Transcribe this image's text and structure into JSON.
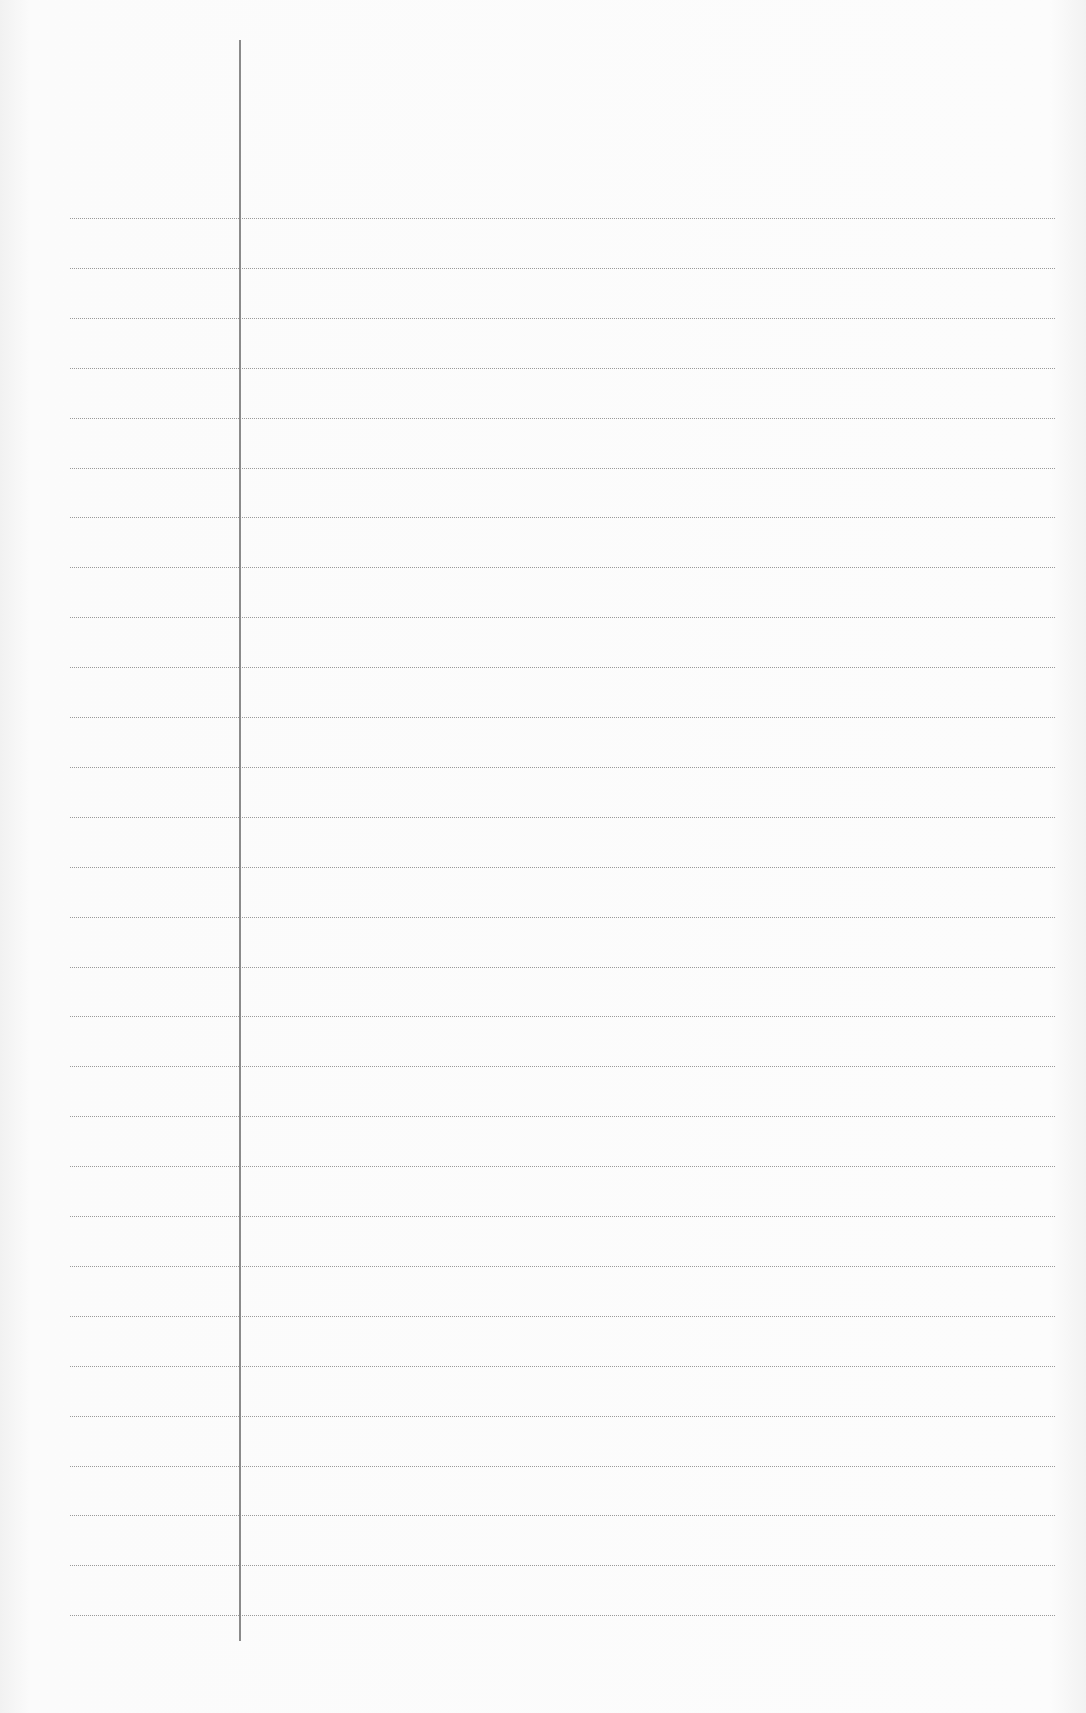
{
  "page": {
    "type": "lined-notebook-paper",
    "content": "",
    "line_count": 29,
    "colors": {
      "paper": "#fbfbfb",
      "rule_line": "#9a9a9a",
      "margin_line": "#8a8a8a"
    }
  }
}
